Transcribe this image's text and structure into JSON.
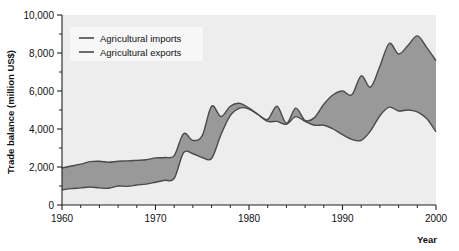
{
  "chart_data": {
    "type": "area",
    "title": "",
    "xlabel": "Year",
    "ylabel": "Trade balance (million US$)",
    "xlim": [
      1960,
      2000
    ],
    "ylim": [
      0,
      10000
    ],
    "grid": false,
    "legend_position": "top-left",
    "x_ticks_major": [
      1960,
      1970,
      1980,
      1990,
      2000
    ],
    "x_ticks_minor_step": 2,
    "y_ticks_major": [
      0,
      2000,
      4000,
      6000,
      8000,
      10000
    ],
    "y_ticks_minor_step": 1000,
    "x_tick_labels": [
      "1960",
      "1970",
      "1980",
      "1990",
      "2000"
    ],
    "y_tick_labels": [
      "0",
      "2,000",
      "4,000",
      "6,000",
      "8,000",
      "10,000"
    ],
    "fill_color": "#999999",
    "line_color": "#4a4a4a",
    "plot_background": "#ededed",
    "x": [
      1960,
      1961,
      1962,
      1963,
      1964,
      1965,
      1966,
      1967,
      1968,
      1969,
      1970,
      1971,
      1972,
      1973,
      1974,
      1975,
      1976,
      1977,
      1978,
      1979,
      1980,
      1981,
      1982,
      1983,
      1984,
      1985,
      1986,
      1987,
      1988,
      1989,
      1990,
      1991,
      1992,
      1993,
      1994,
      1995,
      1996,
      1997,
      1998,
      1999,
      2000
    ],
    "series": [
      {
        "name": "Agricultural imports",
        "values": [
          1950,
          2050,
          2150,
          2280,
          2300,
          2250,
          2300,
          2320,
          2350,
          2380,
          2480,
          2500,
          2600,
          3750,
          3400,
          3650,
          5200,
          4650,
          5200,
          5350,
          5100,
          4750,
          4500,
          5200,
          4300,
          5100,
          4450,
          4600,
          5300,
          5800,
          6000,
          5800,
          6800,
          6200,
          7300,
          8500,
          7950,
          8400,
          8900,
          8300,
          7600
        ]
      },
      {
        "name": "Agricultural exports",
        "values": [
          800,
          860,
          900,
          950,
          900,
          880,
          1000,
          980,
          1050,
          1100,
          1200,
          1300,
          1400,
          2750,
          2700,
          2500,
          2450,
          3700,
          4700,
          5100,
          5050,
          4750,
          4400,
          4400,
          4250,
          4650,
          4400,
          4200,
          4200,
          4000,
          3700,
          3450,
          3400,
          3900,
          4700,
          5150,
          4950,
          5000,
          4900,
          4550,
          3850
        ]
      }
    ],
    "legend_entries": [
      "Agricultural imports",
      "Agricultural exports"
    ]
  },
  "figure": {
    "axis_title_y": "Trade balance (million US$)",
    "axis_title_x": "Year"
  }
}
